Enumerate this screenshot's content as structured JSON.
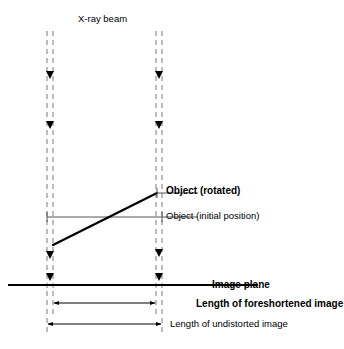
{
  "figure": {
    "width": 344,
    "height": 349,
    "background_color": "#ffffff",
    "line_color": "#000000",
    "thin_line_color": "#555555",
    "dashed_line_color": "#7a7a7a"
  },
  "labels": {
    "xray_beam": "X-ray beam",
    "object_rotated": "Object (rotated)",
    "object_initial": "Object (initial position)",
    "image_plane": "Image plane",
    "length_foreshortened": "Length of foreshortened image",
    "length_undistorted": "Length of undistorted image"
  },
  "geometry": {
    "beam_left_outer_x": 47,
    "beam_left_inner_x": 53,
    "beam_right_inner_x": 156,
    "beam_right_outer_x": 162,
    "beam_top_y": 31,
    "beam_bottom_y": 290,
    "object_initial_y": 217,
    "object_initial_x1": 47,
    "object_initial_x2": 162,
    "object_rotated_x1": 53,
    "object_rotated_y1": 245,
    "object_rotated_x2": 157,
    "object_rotated_y2": 193,
    "image_plane_y": 285,
    "image_plane_x1": 8,
    "image_plane_x2": 258,
    "foreshortened_arrow_y": 303,
    "foreshortened_x1": 53,
    "foreshortened_x2": 156,
    "undistorted_arrow_y": 324,
    "undistorted_x1": 47,
    "undistorted_x2": 162,
    "beam_arrow_ys": [
      75,
      125,
      255,
      277
    ]
  }
}
